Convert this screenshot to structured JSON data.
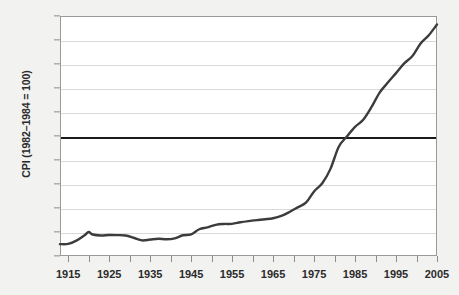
{
  "chart_data": {
    "type": "line",
    "title": "",
    "xlabel": "",
    "ylabel": "CPI (1982–1984 = 100)",
    "xlim": [
      1913,
      2005
    ],
    "ylim": [
      0,
      200
    ],
    "yticks": [
      0,
      20,
      40,
      60,
      80,
      100,
      120,
      140,
      160,
      180,
      200
    ],
    "xticks": [
      1915,
      1920,
      1925,
      1930,
      1935,
      1940,
      1945,
      1950,
      1955,
      1960,
      1965,
      1970,
      1975,
      1980,
      1985,
      1990,
      1995,
      2000,
      2005
    ],
    "xtick_labels": [
      "1915",
      "",
      "1925",
      "",
      "1935",
      "",
      "1945",
      "",
      "1955",
      "",
      "1965",
      "",
      "1975",
      "",
      "1985",
      "",
      "1995",
      "",
      "2005"
    ],
    "grid": "horizontal",
    "legend": "none",
    "reference_line": {
      "value": 100,
      "color": "#1a1a1a",
      "label": ""
    },
    "series": [
      {
        "name": "CPI",
        "color": "#3c3c3c",
        "x": [
          1913,
          1915,
          1917,
          1919,
          1920,
          1921,
          1923,
          1925,
          1927,
          1929,
          1931,
          1933,
          1935,
          1937,
          1939,
          1941,
          1943,
          1945,
          1947,
          1949,
          1951,
          1953,
          1955,
          1957,
          1959,
          1961,
          1963,
          1965,
          1967,
          1969,
          1971,
          1973,
          1975,
          1977,
          1979,
          1981,
          1983,
          1985,
          1987,
          1989,
          1991,
          1993,
          1995,
          1997,
          1999,
          2001,
          2003,
          2005
        ],
        "y": [
          9.9,
          10.1,
          12.8,
          17.3,
          20.0,
          17.9,
          17.1,
          17.5,
          17.4,
          17.1,
          15.2,
          13.0,
          13.7,
          14.4,
          13.9,
          14.7,
          17.3,
          18.0,
          22.3,
          23.8,
          26.0,
          26.7,
          26.8,
          28.1,
          29.1,
          29.9,
          30.6,
          31.5,
          33.4,
          36.7,
          40.5,
          44.4,
          53.8,
          60.6,
          72.6,
          90.9,
          99.6,
          107.6,
          113.6,
          124.0,
          136.2,
          144.5,
          152.4,
          160.5,
          166.6,
          177.1,
          184.0,
          193.0
        ]
      }
    ]
  }
}
